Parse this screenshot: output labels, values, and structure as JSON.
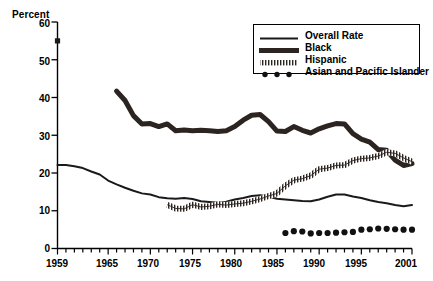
{
  "axis": {
    "ylabel": "Percent",
    "yticks": [
      "0",
      "10",
      "20",
      "30",
      "40",
      "50",
      "60"
    ],
    "xticks": [
      "1959",
      "1965",
      "1970",
      "1975",
      "1980",
      "1985",
      "1990",
      "1995",
      "2001"
    ]
  },
  "legend": {
    "items": [
      {
        "label": "Overall Rate",
        "style": "thin-line",
        "color": "#1a1a1a"
      },
      {
        "label": "Black",
        "style": "thick-line",
        "color": "#2b2420"
      },
      {
        "label": "Hispanic",
        "style": "hatched-line",
        "color": "#2b2420"
      },
      {
        "label": "Asian and Pacific Islander",
        "style": "dots",
        "color": "#111111"
      }
    ]
  },
  "chart_data": {
    "type": "line",
    "title": "",
    "xlabel": "",
    "ylabel": "Percent",
    "xlim": [
      1959,
      2001
    ],
    "ylim": [
      0,
      60
    ],
    "grid": false,
    "legend_position": "top-right",
    "xticks": [
      1959,
      1965,
      1970,
      1975,
      1980,
      1985,
      1990,
      1995,
      2001
    ],
    "yticks": [
      0,
      10,
      20,
      30,
      40,
      50,
      60
    ],
    "annotations": [
      {
        "text": "Black 1959 single marker",
        "x": 1959,
        "y": 55,
        "marker": "square"
      }
    ],
    "series": [
      {
        "name": "Overall Rate",
        "style": "thin-line",
        "x": [
          1959,
          1960,
          1961,
          1962,
          1963,
          1964,
          1965,
          1966,
          1967,
          1968,
          1969,
          1970,
          1971,
          1972,
          1973,
          1974,
          1975,
          1976,
          1977,
          1978,
          1979,
          1980,
          1981,
          1982,
          1983,
          1984,
          1985,
          1986,
          1987,
          1988,
          1989,
          1990,
          1991,
          1992,
          1993,
          1994,
          1995,
          1996,
          1997,
          1998,
          1999,
          2000,
          2001
        ],
        "y": [
          22.1,
          22.1,
          21.8,
          21.3,
          20.4,
          19.6,
          18.0,
          17.0,
          16.1,
          15.3,
          14.6,
          14.3,
          13.6,
          13.3,
          13.2,
          13.4,
          13.1,
          12.5,
          12.3,
          12.1,
          12.4,
          13.0,
          13.4,
          13.9,
          14.1,
          13.8,
          13.2,
          13.0,
          12.8,
          12.6,
          12.5,
          13.0,
          13.7,
          14.3,
          14.3,
          13.8,
          13.4,
          12.8,
          12.3,
          12.0,
          11.5,
          11.2,
          11.5
        ]
      },
      {
        "name": "Black",
        "style": "thick-line",
        "x": [
          1966,
          1967,
          1968,
          1969,
          1970,
          1971,
          1972,
          1973,
          1974,
          1975,
          1976,
          1977,
          1978,
          1979,
          1980,
          1981,
          1982,
          1983,
          1984,
          1985,
          1986,
          1987,
          1988,
          1989,
          1990,
          1991,
          1992,
          1993,
          1994,
          1995,
          1996,
          1997,
          1998,
          1999,
          2000,
          2001
        ],
        "y": [
          41.7,
          39.2,
          35.2,
          33.0,
          33.1,
          32.3,
          33.0,
          31.2,
          31.4,
          31.2,
          31.3,
          31.2,
          31.0,
          31.2,
          32.3,
          34.0,
          35.3,
          35.5,
          33.6,
          31.1,
          31.0,
          32.3,
          31.3,
          30.6,
          31.7,
          32.5,
          33.1,
          33.0,
          30.4,
          29.0,
          28.2,
          26.2,
          26.0,
          23.4,
          22.0,
          22.5
        ]
      },
      {
        "name": "Hispanic",
        "style": "hatched-line",
        "x": [
          1972,
          1973,
          1974,
          1975,
          1976,
          1977,
          1978,
          1979,
          1980,
          1981,
          1982,
          1983,
          1984,
          1985,
          1986,
          1987,
          1988,
          1989,
          1990,
          1991,
          1992,
          1993,
          1994,
          1995,
          1996,
          1997,
          1998,
          1999,
          2000,
          2001
        ],
        "y": [
          11.6,
          10.6,
          10.5,
          11.6,
          11.0,
          11.2,
          11.7,
          11.5,
          11.8,
          12.0,
          12.5,
          13.1,
          13.9,
          14.6,
          16.6,
          18.1,
          18.5,
          19.3,
          21.0,
          21.3,
          22.0,
          22.1,
          23.3,
          23.8,
          24.0,
          24.5,
          25.5,
          25.2,
          24.0,
          23.0
        ]
      },
      {
        "name": "Asian and Pacific Islander",
        "style": "dots",
        "x": [
          1986,
          1987,
          1988,
          1989,
          1990,
          1991,
          1992,
          1993,
          1994,
          1995,
          1996,
          1997,
          1998,
          1999,
          2000,
          2001
        ],
        "y": [
          4.1,
          4.6,
          4.5,
          4.0,
          4.1,
          4.1,
          4.2,
          4.3,
          4.4,
          5.0,
          5.1,
          5.3,
          5.2,
          5.1,
          5.0,
          5.0
        ]
      }
    ]
  }
}
